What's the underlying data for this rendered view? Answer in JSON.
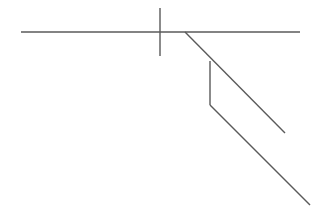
{
  "diagram": {
    "width": 319,
    "height": 211,
    "background": "#ffffff",
    "stroke_color": "#5a5a5a",
    "stroke_width": 1.4,
    "segments": [
      {
        "name": "horizontal-line",
        "x1": 21,
        "y1": 32,
        "x2": 300,
        "y2": 32
      },
      {
        "name": "vertical-cross-line",
        "x1": 160,
        "y1": 8,
        "x2": 160,
        "y2": 56
      },
      {
        "name": "upper-diagonal-line",
        "x1": 185,
        "y1": 32,
        "x2": 285,
        "y2": 133
      },
      {
        "name": "vertical-connector-line",
        "x1": 210,
        "y1": 61,
        "x2": 210,
        "y2": 105
      },
      {
        "name": "lower-diagonal-line",
        "x1": 210,
        "y1": 105,
        "x2": 310,
        "y2": 205
      }
    ]
  }
}
